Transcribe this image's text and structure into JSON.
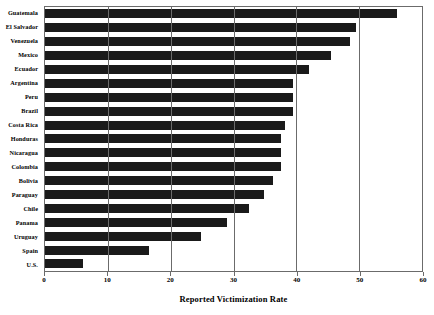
{
  "chart_data": {
    "type": "bar",
    "orientation": "horizontal",
    "title": "",
    "xlabel": "Reported Victimization Rate",
    "ylabel": "",
    "xlim": [
      0,
      60
    ],
    "xticks": [
      0,
      10,
      20,
      30,
      40,
      50,
      60
    ],
    "xtick_labels": [
      "0",
      "10",
      "20",
      "30",
      "40",
      "50",
      "60"
    ],
    "grid": true,
    "grid_axis": "x",
    "legend": false,
    "bar_color": "#1a1a1a",
    "categories": [
      "Guatemala",
      "El Salvador",
      "Venezuela",
      "Mexico",
      "Ecuador",
      "Argentina",
      "Peru",
      "Brazil",
      "Costa Rica",
      "Honduras",
      "Nicaragua",
      "Colombia",
      "Bolivia",
      "Paraguay",
      "Chile",
      "Panama",
      "Uruguay",
      "Spain",
      "U.S."
    ],
    "values": [
      56.0,
      49.5,
      48.5,
      45.5,
      42.0,
      39.5,
      39.5,
      39.5,
      38.2,
      37.5,
      37.5,
      37.5,
      36.3,
      34.8,
      32.4,
      28.9,
      24.8,
      16.5,
      6.0
    ]
  }
}
